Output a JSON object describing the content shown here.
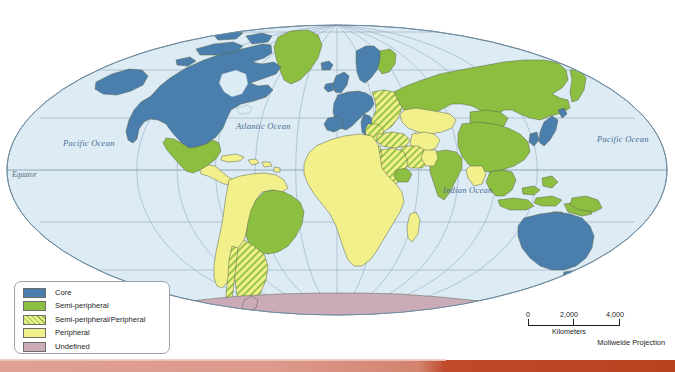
{
  "map": {
    "title": "World-Systems Classification Map",
    "projection_label": "Mollweide Projection",
    "ocean_labels": [
      {
        "name": "pacific-west",
        "text": "Pacific Ocean"
      },
      {
        "name": "atlantic",
        "text": "Atlantic Ocean"
      },
      {
        "name": "indian",
        "text": "Indian Ocean"
      },
      {
        "name": "pacific-east",
        "text": "Pacific Ocean"
      }
    ],
    "equator_label": "Equator",
    "colors": {
      "ocean": "#dcecf4",
      "graticule": "#7e95a8",
      "core": "#4a7fad",
      "semi_peripheral": "#8cbe3f",
      "semi_peripheral_peripheral": "#e9ef87",
      "peripheral": "#f2f08a",
      "undefined": "#ccabb8",
      "country_border": "#6a6a55",
      "coastline": "#4a5a4a",
      "accent_bar_left": "#e0a094",
      "accent_bar_right": "#b8421f"
    }
  },
  "legend": {
    "items": [
      {
        "label": "Core",
        "swatch": "core",
        "color": "#4a7fad"
      },
      {
        "label": "Semi-peripheral",
        "swatch": "semi",
        "color": "#8cbe3f"
      },
      {
        "label": "Semi-peripheral/Peripheral",
        "swatch": "semiperi",
        "color": "#e9ef87"
      },
      {
        "label": "Peripheral",
        "swatch": "peri",
        "color": "#f2f08a"
      },
      {
        "label": "Undefined",
        "swatch": "undef",
        "color": "#ccabb8"
      }
    ]
  },
  "scale": {
    "ticks": [
      "0",
      "2,000",
      "4,000"
    ],
    "units": "Kilometers"
  },
  "regions": {
    "core": [
      "United States",
      "Canada",
      "Western Europe",
      "United Kingdom",
      "Ireland",
      "France",
      "Germany",
      "Italy",
      "Spain",
      "Portugal",
      "Netherlands",
      "Belgium",
      "Switzerland",
      "Austria",
      "Denmark",
      "Norway",
      "Sweden",
      "Finland",
      "Japan",
      "South Korea",
      "Australia",
      "Greenland",
      "Iceland"
    ],
    "semi_peripheral": [
      "Mexico",
      "Brazil",
      "Russia",
      "China",
      "India",
      "Mongolia",
      "Indonesia",
      "Malaysia",
      "Philippines",
      "Thailand",
      "Vietnam",
      "New Zealand",
      "Papua New Guinea",
      "South Africa",
      "Norway-Sweden-north"
    ],
    "semi_peripheral_peripheral": [
      "Argentina",
      "Chile",
      "Uruguay",
      "Poland",
      "Czechia",
      "Hungary",
      "Romania",
      "Bulgaria",
      "Ukraine",
      "Belarus",
      "Turkey",
      "Iran",
      "Saudi Arabia",
      "Iraq",
      "Egypt-east",
      "Pakistan",
      "Greece",
      "Serbia"
    ],
    "peripheral": [
      "Most of Africa",
      "Central America",
      "Colombia",
      "Venezuela",
      "Peru",
      "Bolivia",
      "Ecuador",
      "Paraguay",
      "Kazakhstan",
      "Uzbekistan",
      "Turkmenistan",
      "Afghanistan",
      "Myanmar",
      "Bangladesh",
      "Caribbean islands"
    ],
    "undefined": [
      "Antarctica"
    ]
  }
}
